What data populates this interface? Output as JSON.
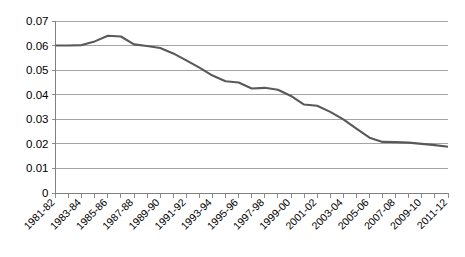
{
  "chart_data": {
    "type": "line",
    "title": "",
    "subtitle": "",
    "xlabel": "",
    "ylabel": "",
    "ylim": [
      0,
      0.07
    ],
    "ytick_labels": [
      "0.07",
      "0.06",
      "0.05",
      "0.04",
      "0.03",
      "0.02",
      "0.01",
      "0"
    ],
    "ytick_values": [
      0.07,
      0.06,
      0.05,
      0.04,
      0.03,
      0.02,
      0.01,
      0
    ],
    "grid": true,
    "legend": false,
    "legend_position": "none",
    "line_color": "#595959",
    "categories": [
      "1981-82",
      "1982-83",
      "1983-84",
      "1984-85",
      "1985-86",
      "1986-87",
      "1987-88",
      "1988-89",
      "1989-90",
      "1990-91",
      "1991-92",
      "1992-93",
      "1993-94",
      "1994-95",
      "1995-96",
      "1996-97",
      "1997-98",
      "1998-99",
      "1999-00",
      "2000-01",
      "2001-02",
      "2002-03",
      "2003-04",
      "2004-05",
      "2005-06",
      "2006-07",
      "2007-08",
      "2008-09",
      "2009-10",
      "2010-11",
      "2011-12"
    ],
    "xtick_labels": [
      "1981-82",
      "1983-84",
      "1985-86",
      "1987-88",
      "1989-90",
      "1991-92",
      "1993-94",
      "1995-96",
      "1997-98",
      "1999-00",
      "2001-02",
      "2003-04",
      "2005-06",
      "2007-08",
      "2009-10",
      "2011-12"
    ],
    "values": [
      0.06,
      0.06,
      0.0602,
      0.0617,
      0.064,
      0.0637,
      0.0605,
      0.0598,
      0.059,
      0.0568,
      0.054,
      0.051,
      0.0478,
      0.0455,
      0.045,
      0.0425,
      0.0428,
      0.042,
      0.0395,
      0.036,
      0.0355,
      0.033,
      0.03,
      0.0262,
      0.0225,
      0.0208,
      0.0207,
      0.0205,
      0.02,
      0.0195,
      0.0188
    ]
  }
}
